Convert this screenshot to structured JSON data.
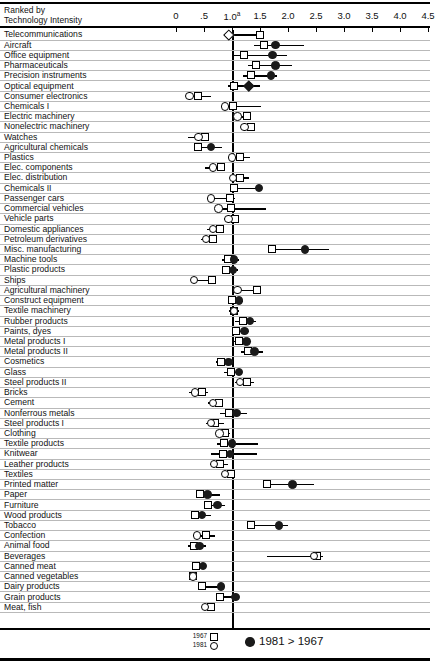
{
  "header": {
    "rank_caption_line1": "Ranked by",
    "rank_caption_line2": "Technology Intensity"
  },
  "legend": {
    "year_old": "1967",
    "year_new": "1981",
    "old_marker": "square-marker",
    "new_marker": "circle-marker",
    "filled_dot_note": "1981 > 1967",
    "filled_dot_icon": "filled-circle-icon"
  },
  "chart_data": {
    "type": "scatter",
    "title": "",
    "subtitle": "",
    "xlabel": "",
    "ylabel": "Ranked by Technology Intensity",
    "xlim": [
      -0.35,
      4.65
    ],
    "xticks": [
      0,
      0.5,
      1.0,
      1.5,
      2.0,
      2.5,
      3.0,
      3.5,
      4.0,
      4.5
    ],
    "xticklabels": [
      "0",
      ".5",
      "1.0",
      "1.5",
      "2.0",
      "2.5",
      "3.0",
      "3.5",
      "4.0",
      "4.5"
    ],
    "xtick_footnote_at": "1.0",
    "xtick_footnote_mark": "a",
    "reference_line": 1.0,
    "grid": "horizontal-row-rules",
    "legend_position": "bottom",
    "series": [
      {
        "name": "1967",
        "marker": "square"
      },
      {
        "name": "1981",
        "marker": "circle"
      },
      {
        "name": "1981 > 1967",
        "marker": "filled-circle"
      }
    ],
    "categories": [
      "Telecommunications",
      "Aircraft",
      "Office equipment",
      "Pharmaceuticals",
      "Precision instruments",
      "Optical equipment",
      "Consumer electronics",
      "Chemicals I",
      "Electric machinery",
      "Nonelectric machinery",
      "Watches",
      "Agricultural chemicals",
      "Plastics",
      "Elec. components",
      "Elec. distribution",
      "Chemicals II",
      "Passenger cars",
      "Commercial vehicles",
      "Vehicle parts",
      "Domestic appliances",
      "Petroleum derivatives",
      "Misc. manufacturing",
      "Machine tools",
      "Plastic products",
      "Ships",
      "Agricultural machinery",
      "Construct equipment",
      "Textile machinery",
      "Rubber products",
      "Paints, dyes",
      "Metal products I",
      "Metal products II",
      "Cosmetics",
      "Glass",
      "Steel products II",
      "Bricks",
      "Cement",
      "Nonferrous metals",
      "Steel products I",
      "Clothing",
      "Textile products",
      "Knitwear",
      "Leather products",
      "Textiles",
      "Printed matter",
      "Paper",
      "Furniture",
      "Wood products",
      "Tobacco",
      "Confection",
      "Animal food",
      "Beverages",
      "Canned meat",
      "Canned vegetables",
      "Dairy products",
      "Grain products",
      "Meat, fish"
    ],
    "rows": [
      {
        "label": "Telecommunications",
        "v1967": 1.5,
        "v1981": 0.95,
        "whisker": [
          0.95,
          1.5
        ],
        "filled": false,
        "marker1981": "diamond"
      },
      {
        "label": "Aircraft",
        "v1967": 1.58,
        "v1981": 1.78,
        "whisker": [
          1.4,
          2.28
        ],
        "filled": true
      },
      {
        "label": "Office equipment",
        "v1967": 1.22,
        "v1981": 1.72,
        "whisker": [
          1.0,
          1.98
        ],
        "filled": true
      },
      {
        "label": "Pharmaceuticals",
        "v1967": 1.42,
        "v1981": 1.78,
        "whisker": [
          1.28,
          2.08
        ],
        "filled": true
      },
      {
        "label": "Precision instruments",
        "v1967": 1.34,
        "v1981": 1.7,
        "whisker": [
          1.2,
          1.8
        ],
        "filled": true
      },
      {
        "label": "Optical equipment",
        "v1967": 1.03,
        "v1981": 1.3,
        "whisker": [
          0.92,
          1.5
        ],
        "filled": true,
        "marker1981": "diamond"
      },
      {
        "label": "Consumer electronics",
        "v1967": 0.4,
        "v1981": 0.24,
        "whisker": [
          0.24,
          0.62
        ],
        "filled": false
      },
      {
        "label": "Chemicals I",
        "v1967": 1.02,
        "v1981": 0.88,
        "whisker": [
          0.88,
          1.52
        ],
        "filled": false
      },
      {
        "label": "Electric machinery",
        "v1967": 1.26,
        "v1981": 1.1,
        "whisker": [
          1.02,
          1.3
        ],
        "filled": false
      },
      {
        "label": "Nonelectric machinery",
        "v1967": 1.34,
        "v1981": 1.22,
        "whisker": [
          1.16,
          1.38
        ],
        "filled": false
      },
      {
        "label": "Watches",
        "v1967": 0.52,
        "v1981": 0.4,
        "whisker": [
          0.22,
          0.58
        ],
        "filled": false
      },
      {
        "label": "Agricultural chemicals",
        "v1967": 0.4,
        "v1981": 0.62,
        "whisker": [
          0.32,
          0.82
        ],
        "filled": true
      },
      {
        "label": "Plastics",
        "v1967": 1.14,
        "v1981": 1.0,
        "whisker": [
          1.0,
          1.32
        ],
        "filled": false
      },
      {
        "label": "Elec. components",
        "v1967": 0.8,
        "v1981": 0.66,
        "whisker": [
          0.52,
          0.82
        ],
        "filled": false
      },
      {
        "label": "Elec. distribution",
        "v1967": 1.14,
        "v1981": 1.02,
        "whisker": [
          1.0,
          1.3
        ],
        "filled": false
      },
      {
        "label": "Chemicals II",
        "v1967": 1.04,
        "v1981": 1.48,
        "whisker": [
          0.98,
          1.52
        ],
        "filled": true
      },
      {
        "label": "Passenger cars",
        "v1967": 0.96,
        "v1981": 0.62,
        "whisker": [
          0.62,
          1.06
        ],
        "filled": false
      },
      {
        "label": "Commercial vehicles",
        "v1967": 0.98,
        "v1981": 0.76,
        "whisker": [
          0.76,
          1.6
        ],
        "filled": false
      },
      {
        "label": "Vehicle parts",
        "v1967": 1.06,
        "v1981": 0.94,
        "whisker": [
          0.86,
          1.12
        ],
        "filled": false
      },
      {
        "label": "Domestic appliances",
        "v1967": 0.78,
        "v1981": 0.66,
        "whisker": [
          0.56,
          0.84
        ],
        "filled": false
      },
      {
        "label": "Petroleum derivatives",
        "v1967": 0.66,
        "v1981": 0.54,
        "whisker": [
          0.44,
          0.72
        ],
        "filled": false
      },
      {
        "label": "Misc. manufacturing",
        "v1967": 1.72,
        "v1981": 2.3,
        "whisker": [
          1.72,
          2.74
        ],
        "filled": true
      },
      {
        "label": "Machine tools",
        "v1967": 0.92,
        "v1981": 1.04,
        "whisker": [
          0.82,
          1.12
        ],
        "filled": true
      },
      {
        "label": "Plastic products",
        "v1967": 0.9,
        "v1981": 1.02,
        "whisker": [
          0.84,
          1.1
        ],
        "filled": true
      },
      {
        "label": "Ships",
        "v1967": 0.64,
        "v1981": 0.32,
        "whisker": [
          0.32,
          0.72
        ],
        "filled": false
      },
      {
        "label": "Agricultural machinery",
        "v1967": 1.44,
        "v1981": 1.1,
        "whisker": [
          1.1,
          1.5
        ],
        "filled": false
      },
      {
        "label": "Construct equipment",
        "v1967": 1.0,
        "v1981": 1.12,
        "whisker": [
          0.96,
          1.2
        ],
        "filled": true
      },
      {
        "label": "Textile machinery",
        "v1967": 1.04,
        "v1981": 1.04,
        "whisker": [
          0.94,
          1.12
        ],
        "filled": false
      },
      {
        "label": "Rubber products",
        "v1967": 1.2,
        "v1981": 1.32,
        "whisker": [
          1.06,
          1.42
        ],
        "filled": true
      },
      {
        "label": "Paints, dyes",
        "v1967": 1.08,
        "v1981": 1.22,
        "whisker": [
          1.0,
          1.3
        ],
        "filled": true
      },
      {
        "label": "Metal products I",
        "v1967": 1.12,
        "v1981": 1.26,
        "whisker": [
          1.02,
          1.34
        ],
        "filled": true
      },
      {
        "label": "Metal products II",
        "v1967": 1.28,
        "v1981": 1.4,
        "whisker": [
          1.16,
          1.56
        ],
        "filled": true
      },
      {
        "label": "Cosmetics",
        "v1967": 0.8,
        "v1981": 0.94,
        "whisker": [
          0.72,
          1.04
        ],
        "filled": true
      },
      {
        "label": "Glass",
        "v1967": 0.98,
        "v1981": 1.12,
        "whisker": [
          0.86,
          1.18
        ],
        "filled": true
      },
      {
        "label": "Steel products II",
        "v1967": 1.26,
        "v1981": 1.14,
        "whisker": [
          1.06,
          1.4
        ],
        "filled": false
      },
      {
        "label": "Bricks",
        "v1967": 0.46,
        "v1981": 0.34,
        "whisker": [
          0.24,
          0.58
        ],
        "filled": false
      },
      {
        "label": "Cement",
        "v1967": 0.76,
        "v1981": 0.66,
        "whisker": [
          0.58,
          0.84
        ],
        "filled": false
      },
      {
        "label": "Nonferrous metals",
        "v1967": 0.94,
        "v1981": 1.08,
        "whisker": [
          0.78,
          1.26
        ],
        "filled": true
      },
      {
        "label": "Steel products I",
        "v1967": 0.7,
        "v1981": 0.62,
        "whisker": [
          0.54,
          0.86
        ],
        "filled": false
      },
      {
        "label": "Clothing",
        "v1967": 0.88,
        "v1981": 0.78,
        "whisker": [
          0.7,
          0.96
        ],
        "filled": false
      },
      {
        "label": "Textile products",
        "v1967": 0.86,
        "v1981": 1.0,
        "whisker": [
          0.74,
          1.46
        ],
        "filled": true
      },
      {
        "label": "Knitwear",
        "v1967": 0.84,
        "v1981": 0.96,
        "whisker": [
          0.62,
          1.44
        ],
        "filled": true
      },
      {
        "label": "Leather products",
        "v1967": 0.78,
        "v1981": 0.68,
        "whisker": [
          0.6,
          0.92
        ],
        "filled": false
      },
      {
        "label": "Textiles",
        "v1967": 0.98,
        "v1981": 0.88,
        "whisker": [
          0.82,
          1.06
        ],
        "filled": false
      },
      {
        "label": "Printed matter",
        "v1967": 1.62,
        "v1981": 2.08,
        "whisker": [
          1.62,
          2.46
        ],
        "filled": true
      },
      {
        "label": "Paper",
        "v1967": 0.42,
        "v1981": 0.56,
        "whisker": [
          0.42,
          0.78
        ],
        "filled": true
      },
      {
        "label": "Furniture",
        "v1967": 0.58,
        "v1981": 0.74,
        "whisker": [
          0.58,
          0.88
        ],
        "filled": true
      },
      {
        "label": "Wood products",
        "v1967": 0.34,
        "v1981": 0.46,
        "whisker": [
          0.26,
          0.62
        ],
        "filled": true
      },
      {
        "label": "Tobacco",
        "v1967": 1.34,
        "v1981": 1.84,
        "whisker": [
          1.34,
          2.0
        ],
        "filled": true
      },
      {
        "label": "Confection",
        "v1967": 0.54,
        "v1981": 0.38,
        "whisker": [
          0.38,
          0.7
        ],
        "filled": false
      },
      {
        "label": "Animal food",
        "v1967": 0.32,
        "v1981": 0.42,
        "whisker": [
          0.22,
          0.54
        ],
        "filled": true
      },
      {
        "label": "Beverages",
        "v1967": 2.52,
        "v1981": 2.46,
        "whisker": [
          1.62,
          2.62
        ],
        "filled": false
      },
      {
        "label": "Canned meat",
        "v1967": 0.36,
        "v1981": 0.48,
        "whisker": [
          0.36,
          0.52
        ],
        "filled": true
      },
      {
        "label": "Canned vegetables",
        "v1967": 0.3,
        "v1981": 0.3,
        "whisker": [
          0.26,
          0.36
        ],
        "filled": false
      },
      {
        "label": "Dairy products",
        "v1967": 0.46,
        "v1981": 0.8,
        "whisker": [
          0.46,
          0.82
        ],
        "filled": true
      },
      {
        "label": "Grain products",
        "v1967": 0.78,
        "v1981": 1.06,
        "whisker": [
          0.72,
          1.12
        ],
        "filled": true
      },
      {
        "label": "Meat, fish",
        "v1967": 0.62,
        "v1981": 0.52,
        "whisker": [
          0.48,
          0.7
        ],
        "filled": false
      }
    ]
  }
}
